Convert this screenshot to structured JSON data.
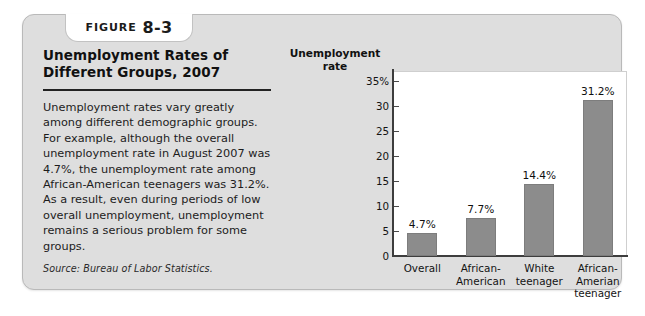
{
  "figure": {
    "tab_word": "Figure",
    "tab_number": "8-3",
    "title_line1": "Unemployment Rates of",
    "title_line2": "Different Groups, 2007",
    "body": "Unemployment rates vary greatly among different demographic groups. For example, although the overall unemployment rate in August 2007 was 4.7%, the unemployment rate among African-American teenagers was 31.2%. As a result, even during periods of low overall unemployment, unemployment remains a serious problem for some groups.",
    "source": "Source: Bureau of Labor Statistics."
  },
  "chart_data": {
    "type": "bar",
    "title": "Unemployment Rates of Different Groups, 2007",
    "ylabel": "Unemployment rate",
    "xlabel": "",
    "categories": [
      "Overall",
      "African-American",
      "White teenager",
      "African-Amerian teenager"
    ],
    "category_lines": [
      [
        "Overall"
      ],
      [
        "African-",
        "American"
      ],
      [
        "White",
        "teenager"
      ],
      [
        "African-",
        "Amerian",
        "teenager"
      ]
    ],
    "values": [
      4.7,
      7.7,
      14.4,
      31.2
    ],
    "value_labels": [
      "4.7%",
      "7.7%",
      "14.4%",
      "31.2%"
    ],
    "ylim": [
      0,
      37
    ],
    "yticks": [
      0,
      5,
      10,
      15,
      20,
      25,
      30,
      35
    ],
    "ytick_labels": [
      "0",
      "5",
      "10",
      "15",
      "20",
      "25",
      "30",
      "35%"
    ],
    "grid": false,
    "legend": false,
    "bar_color": "#8c8c8c",
    "panel_color": "#dedede",
    "plot_bg": "#ffffff"
  }
}
